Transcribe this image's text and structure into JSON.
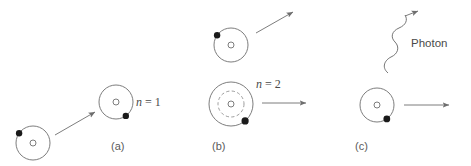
{
  "figure": {
    "width": 471,
    "height": 166,
    "background": "#ffffff",
    "line_color": "#6e6e6e",
    "text_color": "#4a4a4a",
    "electron_color": "#1a1a1a"
  },
  "panels": [
    {
      "id": "a",
      "label": "(a)",
      "label_pos": {
        "x": 111,
        "y": 140
      },
      "description": "free electron approaching ground-state atom",
      "atoms": [
        {
          "name": "atom-incoming-electron",
          "cx": 33,
          "cy": 143,
          "rings": [
            {
              "r": 17,
              "style": "solid"
            }
          ],
          "nucleus_r": 3,
          "electrons": [
            {
              "angle_deg": 215,
              "ring_r": 17,
              "r": 3.2
            }
          ]
        },
        {
          "name": "atom-ground-state",
          "cx": 116,
          "cy": 102,
          "rings": [
            {
              "r": 17,
              "style": "solid"
            }
          ],
          "nucleus_r": 3,
          "electrons": [
            {
              "angle_deg": 55,
              "ring_r": 17,
              "r": 3.2
            }
          ]
        }
      ],
      "arrows": [
        {
          "name": "arrow-electron-incoming",
          "x1": 55,
          "y1": 135,
          "x2": 95,
          "y2": 112,
          "type": "straight"
        }
      ],
      "shell_label": {
        "text_var": "n",
        "text_rest": " = 1",
        "x": 136,
        "y": 95
      }
    },
    {
      "id": "b",
      "label": "(b)",
      "label_pos": {
        "x": 212,
        "y": 140
      },
      "description": "scattered electron leaving, atom excited to n = 2",
      "atoms": [
        {
          "name": "atom-scattered-electron",
          "cx": 231,
          "cy": 45,
          "rings": [
            {
              "r": 17,
              "style": "solid"
            }
          ],
          "nucleus_r": 3,
          "electrons": [
            {
              "angle_deg": 215,
              "ring_r": 17,
              "r": 3.2
            }
          ]
        },
        {
          "name": "atom-excited-state",
          "cx": 231,
          "cy": 104,
          "rings": [
            {
              "r": 22,
              "style": "solid"
            },
            {
              "r": 13,
              "style": "dashed"
            }
          ],
          "nucleus_r": 3,
          "electrons": [
            {
              "angle_deg": 50,
              "ring_r": 22,
              "r": 3.6
            }
          ]
        }
      ],
      "arrows": [
        {
          "name": "arrow-electron-scattered",
          "x1": 256,
          "y1": 33,
          "x2": 293,
          "y2": 12,
          "type": "straight"
        },
        {
          "name": "arrow-time-b",
          "x1": 262,
          "y1": 103,
          "x2": 306,
          "y2": 103,
          "type": "straight"
        }
      ],
      "shell_label": {
        "text_var": "n",
        "text_rest": " = 2",
        "x": 256,
        "y": 77
      }
    },
    {
      "id": "c",
      "label": "(c)",
      "label_pos": {
        "x": 355,
        "y": 140
      },
      "description": "atom de-excites emitting a photon",
      "atoms": [
        {
          "name": "atom-decayed-state",
          "cx": 377,
          "cy": 105,
          "rings": [
            {
              "r": 17,
              "style": "solid"
            }
          ],
          "nucleus_r": 3,
          "electrons": [
            {
              "angle_deg": 55,
              "ring_r": 17,
              "r": 3.2
            }
          ]
        }
      ],
      "arrows": [
        {
          "name": "arrow-photon-emitted",
          "x1": 388,
          "y1": 73,
          "x2": 418,
          "y2": 11,
          "type": "wavy"
        },
        {
          "name": "arrow-time-c",
          "x1": 404,
          "y1": 105,
          "x2": 449,
          "y2": 105,
          "type": "straight"
        }
      ],
      "photon_label": {
        "text": "Photon",
        "x": 411,
        "y": 37
      }
    }
  ]
}
